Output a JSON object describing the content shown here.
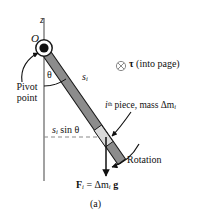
{
  "figure": {
    "panel_label": "(a)",
    "axis_label": "z",
    "pivot_label": "O",
    "angle_label": "θ",
    "arc_length_label": {
      "base": "s",
      "sub": "i"
    },
    "pivot_caption": "Pivot\npoint",
    "pivot_caption_line1": "Pivot",
    "pivot_caption_line2": "point",
    "torque": {
      "symbol_name": "into-page-circle-x",
      "tau": "τ",
      "text": "(into page)"
    },
    "piece_label": {
      "i": "i",
      "th": "th",
      "text": " piece, mass Δm",
      "sub": "i"
    },
    "moment_arm_label": {
      "s": "s",
      "sub": "i",
      "rest": " sin θ"
    },
    "rotation_label": "Rotation",
    "force_label": {
      "F": "F",
      "F_sub": "i",
      "eq": " = Δm",
      "m_sub": "i",
      "g": "g"
    }
  },
  "colors": {
    "rod_fill": "#8c8c8c",
    "rod_stroke": "#1a1a1a",
    "piece_fill": "#d9d9d9",
    "axis_line": "#8a8a8a",
    "dashed_line": "#8a8a8a",
    "ink": "#111111",
    "background": "#ffffff"
  },
  "geometry": {
    "pivot_x": 44,
    "pivot_y": 48,
    "rod_end_x": 120,
    "rod_end_y": 158,
    "axis_top_y": 18,
    "axis_bottom_y": 181,
    "dashed_y": 137,
    "force_arrow_x": 106,
    "force_arrow_top_y": 137,
    "force_arrow_bottom_y": 176,
    "theta_degrees": 35
  }
}
